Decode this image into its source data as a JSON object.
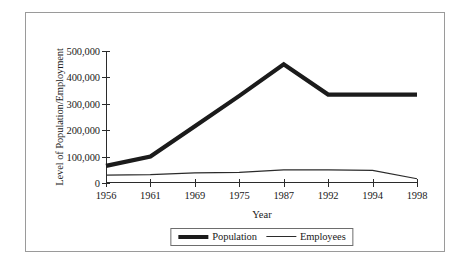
{
  "chart_data": {
    "type": "line",
    "title": "",
    "xlabel": "Year",
    "ylabel": "Level of Population/Employment",
    "categories": [
      "1956",
      "1961",
      "1969",
      "1975",
      "1987",
      "1992",
      "1994",
      "1998"
    ],
    "series": [
      {
        "name": "Population",
        "values": [
          65000,
          100000,
          215000,
          330000,
          450000,
          335000,
          335000,
          335000
        ]
      },
      {
        "name": "Employees",
        "values": [
          30000,
          32000,
          38000,
          40000,
          50000,
          50000,
          48000,
          16000
        ]
      }
    ],
    "ylim": [
      0,
      500000
    ],
    "yticks": [
      0,
      100000,
      200000,
      300000,
      400000,
      500000
    ],
    "ytick_labels": [
      "0",
      "100,000",
      "200,000",
      "300,000",
      "400,000",
      "500,000"
    ],
    "grid": false,
    "legend_position": "bottom",
    "colors": {
      "population": "#1b1b1b",
      "employees": "#2b2b2b",
      "axis": "#2b2b2b",
      "frame": "#9a9a9a",
      "background": "#ffffff"
    }
  },
  "legend": {
    "entries": [
      {
        "label": "Population",
        "style": "thick"
      },
      {
        "label": "Employees",
        "style": "thin"
      }
    ]
  }
}
